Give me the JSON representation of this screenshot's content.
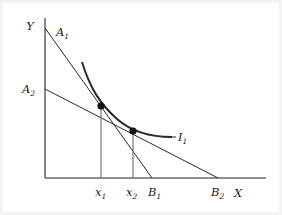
{
  "figure": {
    "background_color": "#ffffff",
    "ink_color": "#1a1a1a",
    "axes": {
      "y_axis_label": "Y",
      "x_axis_label": "X",
      "origin": {
        "x": 45,
        "y": 178
      },
      "y_top": {
        "x": 45,
        "y": 18
      },
      "x_right": {
        "x": 266,
        "y": 178
      }
    },
    "labels": {
      "a1": {
        "base": "A",
        "sub": "1",
        "x": 56,
        "y": 36
      },
      "a2": {
        "base": "A",
        "sub": "2",
        "x": 22,
        "y": 93
      },
      "b1": {
        "base": "B",
        "sub": "1",
        "x": 148,
        "y": 196
      },
      "b2": {
        "base": "B",
        "sub": "2",
        "x": 211,
        "y": 196
      },
      "x1": {
        "base": "x",
        "sub": "1",
        "x": 95,
        "y": 196
      },
      "x2": {
        "base": "x",
        "sub": "2",
        "x": 126,
        "y": 196
      },
      "i1": {
        "base": "I",
        "sub": "1",
        "x": 178,
        "y": 141
      },
      "y_axis": {
        "base": "Y",
        "x": 30,
        "y": 30
      },
      "x_axis": {
        "base": "X",
        "x": 238,
        "y": 197
      }
    },
    "budget_lines": [
      {
        "name": "budget-line-1",
        "intercept_label": "A1",
        "x_intercept_label": "B1",
        "from": {
          "x": 45,
          "y": 28
        },
        "to": {
          "x": 152,
          "y": 178
        },
        "stroke_width": 1.0
      },
      {
        "name": "budget-line-2",
        "intercept_label": "A2",
        "x_intercept_label": "B2",
        "from": {
          "x": 45,
          "y": 89
        },
        "to": {
          "x": 218,
          "y": 178
        },
        "stroke_width": 1.0
      }
    ],
    "indifference_curve": {
      "name": "indifference-curve-I1",
      "label": "I1",
      "path": "M 82 62 C 90 88, 100 104, 117 119 C 133 133, 152 137, 172 137",
      "stroke_width": 2.0
    },
    "tangency_points": [
      {
        "name": "tangency-point-1",
        "x": 101,
        "y": 106,
        "radius": 3.6,
        "associated_x": "x1"
      },
      {
        "name": "tangency-point-2",
        "x": 133,
        "y": 131,
        "radius": 3.6,
        "associated_x": "x2"
      }
    ],
    "droplines": [
      {
        "name": "dropline-x1",
        "x": 101,
        "y_top": 106,
        "y_bottom": 178
      },
      {
        "name": "dropline-x2",
        "x": 133,
        "y_top": 131,
        "y_bottom": 178
      }
    ]
  }
}
